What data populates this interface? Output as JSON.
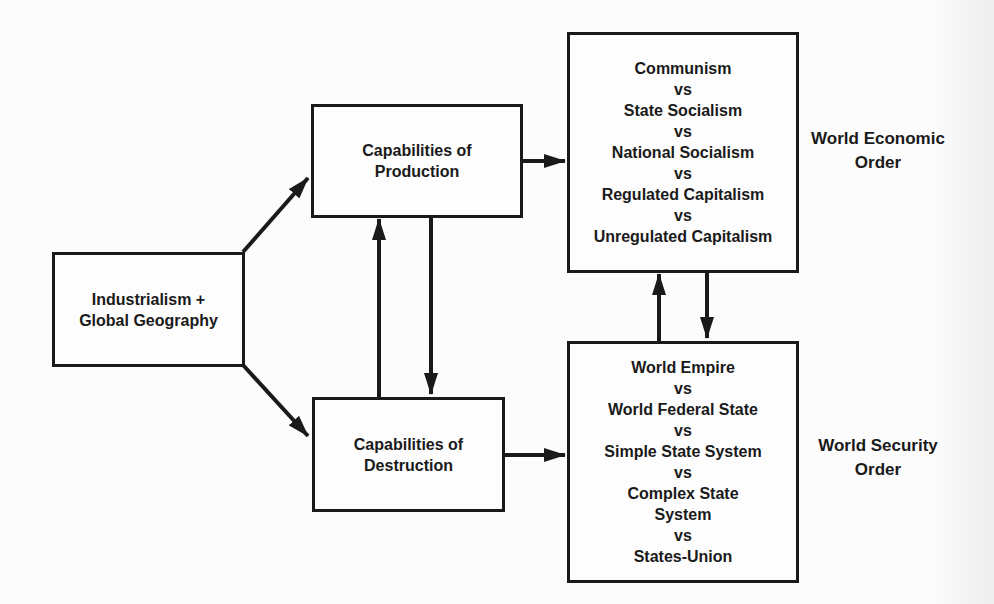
{
  "diagram": {
    "nodes": {
      "source": {
        "lines": [
          "Industrialism +",
          "Global Geography"
        ]
      },
      "production": {
        "lines": [
          "Capabilities of",
          "Production"
        ]
      },
      "destruction": {
        "lines": [
          "Capabilities of",
          "Destruction"
        ]
      },
      "economic_options": {
        "lines": [
          "Communism",
          "vs",
          "State Socialism",
          "vs",
          "National Socialism",
          "vs",
          "Regulated Capitalism",
          "vs",
          "Unregulated Capitalism"
        ]
      },
      "security_options": {
        "lines": [
          "World Empire",
          "vs",
          "World Federal State",
          "vs",
          "Simple State System",
          "vs",
          "Complex State",
          "System",
          "vs",
          "States-Union"
        ]
      }
    },
    "labels": {
      "economic_order": [
        "World Economic",
        "Order"
      ],
      "security_order": [
        "World Security",
        "Order"
      ]
    },
    "edges": [
      {
        "from": "source",
        "to": "production"
      },
      {
        "from": "source",
        "to": "destruction"
      },
      {
        "from": "production",
        "to": "destruction"
      },
      {
        "from": "destruction",
        "to": "production"
      },
      {
        "from": "production",
        "to": "economic_options"
      },
      {
        "from": "destruction",
        "to": "security_options"
      },
      {
        "from": "economic_options",
        "to": "security_options"
      },
      {
        "from": "security_options",
        "to": "economic_options"
      }
    ],
    "colors": {
      "ink": "#1a1a1a",
      "background": "#fcfcfc"
    }
  }
}
